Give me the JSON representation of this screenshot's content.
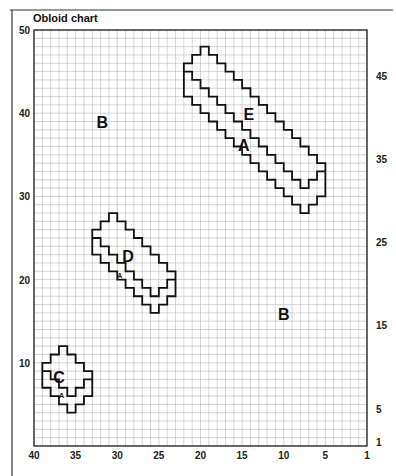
{
  "chart_data": {
    "type": "grid-chart",
    "title": "Obloid chart",
    "grid": {
      "cols": 40,
      "rows": 50,
      "x0": 34,
      "y0": 30,
      "x1": 367,
      "y1": 446
    },
    "x_ticks": [
      {
        "label": "40",
        "col": 0
      },
      {
        "label": "35",
        "col": 5
      },
      {
        "label": "30",
        "col": 10
      },
      {
        "label": "25",
        "col": 15
      },
      {
        "label": "20",
        "col": 20
      },
      {
        "label": "15",
        "col": 25
      },
      {
        "label": "10",
        "col": 30
      },
      {
        "label": "5",
        "col": 35
      },
      {
        "label": "1",
        "col": 40
      }
    ],
    "y_ticks_left": [
      {
        "label": "50",
        "row": 0
      },
      {
        "label": "40",
        "row": 10
      },
      {
        "label": "30",
        "row": 20
      },
      {
        "label": "20",
        "row": 30
      },
      {
        "label": "10",
        "row": 40
      }
    ],
    "y_ticks_right": [
      {
        "label": "45",
        "row": 5.5
      },
      {
        "label": "35",
        "row": 15.5
      },
      {
        "label": "25",
        "row": 25.5
      },
      {
        "label": "15",
        "row": 35.5
      },
      {
        "label": "5",
        "row": 45.5
      },
      {
        "label": "1",
        "row": 49.5
      }
    ],
    "shapes": [
      {
        "name": "shape-E",
        "outline": [
          [
            20,
            2
          ],
          [
            21,
            2
          ],
          [
            21,
            3
          ],
          [
            22,
            3
          ],
          [
            22,
            4
          ],
          [
            23,
            4
          ],
          [
            23,
            5
          ],
          [
            24,
            5
          ],
          [
            24,
            6
          ],
          [
            25,
            6
          ],
          [
            25,
            7
          ],
          [
            26,
            7
          ],
          [
            26,
            8
          ],
          [
            27,
            8
          ],
          [
            27,
            9
          ],
          [
            28,
            9
          ],
          [
            28,
            10
          ],
          [
            29,
            10
          ],
          [
            29,
            11
          ],
          [
            30,
            11
          ],
          [
            30,
            12
          ],
          [
            31,
            12
          ],
          [
            31,
            13
          ],
          [
            32,
            13
          ],
          [
            32,
            14
          ],
          [
            33,
            14
          ],
          [
            33,
            15
          ],
          [
            34,
            15
          ],
          [
            34,
            16
          ],
          [
            35,
            16
          ],
          [
            35,
            20
          ],
          [
            34,
            20
          ],
          [
            34,
            21
          ],
          [
            33,
            21
          ],
          [
            33,
            22
          ],
          [
            32,
            22
          ],
          [
            32,
            21
          ],
          [
            31,
            21
          ],
          [
            31,
            20
          ],
          [
            30,
            20
          ],
          [
            30,
            19
          ],
          [
            29,
            19
          ],
          [
            29,
            18
          ],
          [
            28,
            18
          ],
          [
            28,
            17
          ],
          [
            27,
            17
          ],
          [
            27,
            16
          ],
          [
            26,
            16
          ],
          [
            26,
            15
          ],
          [
            25,
            15
          ],
          [
            25,
            14
          ],
          [
            24,
            14
          ],
          [
            24,
            13
          ],
          [
            23,
            13
          ],
          [
            23,
            12
          ],
          [
            22,
            12
          ],
          [
            22,
            11
          ],
          [
            21,
            11
          ],
          [
            21,
            10
          ],
          [
            20,
            10
          ],
          [
            20,
            9
          ],
          [
            19,
            9
          ],
          [
            19,
            8
          ],
          [
            18,
            8
          ],
          [
            18,
            4
          ],
          [
            19,
            4
          ],
          [
            19,
            3
          ],
          [
            20,
            3
          ]
        ],
        "inner": [
          [
            18,
            5
          ],
          [
            19,
            5
          ],
          [
            19,
            6
          ],
          [
            20,
            6
          ],
          [
            20,
            7
          ],
          [
            21,
            7
          ],
          [
            21,
            8
          ],
          [
            22,
            8
          ],
          [
            22,
            9
          ],
          [
            23,
            9
          ],
          [
            23,
            10
          ],
          [
            24,
            10
          ],
          [
            24,
            11
          ],
          [
            25,
            11
          ],
          [
            25,
            12
          ],
          [
            26,
            12
          ],
          [
            26,
            13
          ],
          [
            27,
            13
          ],
          [
            27,
            14
          ],
          [
            28,
            14
          ],
          [
            28,
            15
          ],
          [
            29,
            15
          ],
          [
            29,
            16
          ],
          [
            30,
            16
          ],
          [
            30,
            17
          ],
          [
            31,
            17
          ],
          [
            31,
            18
          ],
          [
            32,
            18
          ],
          [
            32,
            19
          ],
          [
            33,
            19
          ],
          [
            33,
            18
          ],
          [
            34,
            18
          ],
          [
            34,
            17
          ],
          [
            35,
            17
          ]
        ]
      },
      {
        "name": "shape-D",
        "outline": [
          [
            9,
            22
          ],
          [
            10,
            22
          ],
          [
            10,
            23
          ],
          [
            11,
            23
          ],
          [
            11,
            24
          ],
          [
            12,
            24
          ],
          [
            12,
            25
          ],
          [
            13,
            25
          ],
          [
            13,
            26
          ],
          [
            14,
            26
          ],
          [
            14,
            27
          ],
          [
            15,
            27
          ],
          [
            15,
            28
          ],
          [
            16,
            28
          ],
          [
            16,
            29
          ],
          [
            17,
            29
          ],
          [
            17,
            32
          ],
          [
            16,
            32
          ],
          [
            16,
            33
          ],
          [
            15,
            33
          ],
          [
            15,
            34
          ],
          [
            14,
            34
          ],
          [
            14,
            33
          ],
          [
            13,
            33
          ],
          [
            13,
            32
          ],
          [
            12,
            32
          ],
          [
            12,
            31
          ],
          [
            11,
            31
          ],
          [
            11,
            30
          ],
          [
            10,
            30
          ],
          [
            10,
            29
          ],
          [
            9,
            29
          ],
          [
            9,
            28
          ],
          [
            8,
            28
          ],
          [
            8,
            27
          ],
          [
            7,
            27
          ],
          [
            7,
            24
          ],
          [
            8,
            24
          ],
          [
            8,
            23
          ],
          [
            9,
            23
          ]
        ],
        "inner": [
          [
            7,
            25
          ],
          [
            8,
            25
          ],
          [
            8,
            26
          ],
          [
            9,
            26
          ],
          [
            9,
            27
          ],
          [
            10,
            27
          ],
          [
            10,
            28
          ],
          [
            11,
            28
          ],
          [
            11,
            29
          ],
          [
            12,
            29
          ],
          [
            12,
            30
          ],
          [
            13,
            30
          ],
          [
            13,
            31
          ],
          [
            14,
            31
          ],
          [
            14,
            32
          ],
          [
            15,
            32
          ],
          [
            15,
            31
          ],
          [
            16,
            31
          ],
          [
            16,
            30
          ],
          [
            17,
            30
          ]
        ]
      },
      {
        "name": "shape-C",
        "outline": [
          [
            3,
            38
          ],
          [
            4,
            38
          ],
          [
            4,
            39
          ],
          [
            5,
            39
          ],
          [
            5,
            40
          ],
          [
            6,
            40
          ],
          [
            6,
            41
          ],
          [
            7,
            41
          ],
          [
            7,
            44
          ],
          [
            6,
            44
          ],
          [
            6,
            45
          ],
          [
            5,
            45
          ],
          [
            5,
            46
          ],
          [
            4,
            46
          ],
          [
            4,
            45
          ],
          [
            3,
            45
          ],
          [
            3,
            44
          ],
          [
            2,
            44
          ],
          [
            2,
            43
          ],
          [
            1,
            43
          ],
          [
            1,
            40
          ],
          [
            2,
            40
          ],
          [
            2,
            39
          ],
          [
            3,
            39
          ]
        ],
        "inner": [
          [
            1,
            41
          ],
          [
            2,
            41
          ],
          [
            2,
            42
          ],
          [
            3,
            42
          ],
          [
            3,
            43
          ],
          [
            4,
            43
          ],
          [
            4,
            44
          ],
          [
            5,
            44
          ],
          [
            5,
            43
          ],
          [
            6,
            43
          ],
          [
            6,
            42
          ],
          [
            7,
            42
          ]
        ]
      }
    ],
    "labels": [
      {
        "text": "E",
        "col": 25.8,
        "row": 10.8,
        "size": "big"
      },
      {
        "text": "A",
        "col": 25.2,
        "row": 14.5,
        "size": "big"
      },
      {
        "text": "B",
        "col": 8.2,
        "row": 11.8,
        "size": "big"
      },
      {
        "text": "D",
        "col": 11.3,
        "row": 27.9,
        "size": "big"
      },
      {
        "text": "A",
        "col": 10.3,
        "row": 29.8,
        "size": "small"
      },
      {
        "text": "B",
        "col": 30.0,
        "row": 34.8,
        "size": "big"
      },
      {
        "text": "C",
        "col": 3.0,
        "row": 42.4,
        "size": "big"
      },
      {
        "text": "A",
        "col": 3.3,
        "row": 44.2,
        "size": "small"
      }
    ]
  }
}
